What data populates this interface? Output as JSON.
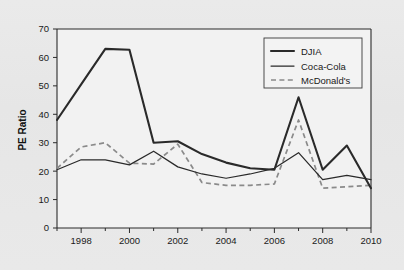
{
  "chart_data": {
    "type": "line",
    "title": "",
    "xlabel": "",
    "ylabel": "PE Ratio",
    "xlim": [
      1997,
      2010
    ],
    "ylim": [
      0,
      70
    ],
    "grid": false,
    "legend_position": "top-right",
    "x": [
      1997,
      1998,
      1999,
      2000,
      2001,
      2002,
      2003,
      2004,
      2005,
      2006,
      2007,
      2008,
      2009,
      2010
    ],
    "xtick_labels": [
      "1998",
      "2000",
      "2002",
      "2004",
      "2006",
      "2008",
      "2010"
    ],
    "xtick_values": [
      1998,
      2000,
      2002,
      2004,
      2006,
      2008,
      2010
    ],
    "xminor_ticks": [
      1997,
      1999,
      2001,
      2003,
      2005,
      2007,
      2009
    ],
    "ytick_labels": [
      "0",
      "10",
      "20",
      "30",
      "40",
      "50",
      "60",
      "70"
    ],
    "ytick_values": [
      0,
      10,
      20,
      30,
      40,
      50,
      60,
      70
    ],
    "series": [
      {
        "name": "DJIA",
        "style": "solid-thick",
        "color": "#2a2a2a",
        "values": [
          38,
          50.5,
          63,
          62.7,
          30,
          30.5,
          26,
          23,
          21,
          20.5,
          46,
          20.5,
          29,
          14
        ]
      },
      {
        "name": "Coca-Cola",
        "style": "solid-thin",
        "color": "#2a2a2a",
        "values": [
          20.5,
          24,
          24,
          22.2,
          27,
          21.5,
          19,
          17.5,
          19,
          21,
          26.5,
          17,
          18.5,
          17
        ]
      },
      {
        "name": "McDonald's",
        "style": "dashed",
        "color": "#8a8a8a",
        "values": [
          21,
          28.5,
          30,
          22.8,
          22.5,
          29.5,
          16,
          15,
          15,
          15.5,
          38,
          14,
          14.5,
          15
        ]
      }
    ]
  },
  "legend": {
    "entries": [
      {
        "label": "DJIA"
      },
      {
        "label": "Coca-Cola"
      },
      {
        "label": "McDonald's"
      }
    ]
  }
}
